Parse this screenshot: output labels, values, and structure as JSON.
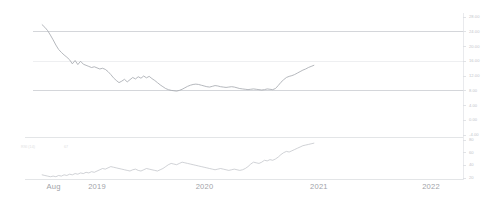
{
  "chart_data": {
    "type": "line",
    "title": "",
    "subtitle": "",
    "xlabel": "",
    "ylabel": "",
    "grid": true,
    "legend_position": "none",
    "panels": [
      {
        "name": "price-panel",
        "ylim": [
          -4,
          28
        ],
        "ytick_labels": [
          "28.00",
          "24.00",
          "20.00",
          "16.00",
          "12.00",
          "8.00",
          "4.00",
          "0.00",
          "-4.00"
        ],
        "ytick_values": [
          28,
          24,
          20,
          16,
          12,
          8,
          4,
          0,
          -4
        ],
        "gridline_values": [
          24,
          16,
          8
        ],
        "series": [
          {
            "name": "price",
            "color": "#a8abb1",
            "x": [
              0.0,
              0.6,
              1.2,
              1.8,
              2.4,
              3.0,
              3.6,
              4.2,
              4.8,
              5.4,
              6.0,
              6.6,
              7.2,
              7.8,
              8.4,
              9.0,
              9.6,
              10.2,
              10.8,
              11.4,
              12.0,
              12.6,
              13.2,
              13.8,
              14.4,
              15.0,
              15.6,
              16.2,
              16.8,
              17.4,
              18.0,
              18.6,
              19.2,
              19.8,
              20.4,
              21.0,
              21.6,
              22.2,
              22.8,
              23.4,
              24.0,
              24.6,
              25.2,
              25.8,
              26.4,
              27.0,
              27.6,
              28.2,
              28.8,
              29.4,
              30.0,
              30.6,
              31.2,
              31.8,
              32.4,
              33.0,
              33.6,
              34.2,
              34.8,
              35.4,
              36.0,
              36.6,
              37.2,
              37.8,
              38.4,
              39.0,
              39.6,
              40.2,
              40.8,
              41.4,
              42.0,
              42.6,
              43.2,
              43.8,
              44.4,
              45.0,
              45.6,
              46.2,
              46.8,
              47.4,
              48.0,
              48.6,
              49.2,
              49.8,
              50.4,
              51.0,
              51.6,
              52.2,
              52.8,
              53.4,
              54.0,
              54.6,
              55.2,
              55.8,
              56.4,
              57.0,
              57.6,
              58.2,
              58.8,
              59.4
            ],
            "y": [
              25.9,
              25.2,
              24.3,
              23.1,
              21.8,
              20.4,
              19.2,
              18.4,
              17.7,
              17.1,
              16.4,
              15.3,
              16.2,
              15.1,
              16.0,
              15.2,
              14.9,
              14.6,
              14.3,
              14.5,
              14.2,
              13.9,
              14.1,
              13.8,
              13.2,
              12.4,
              11.5,
              10.8,
              10.2,
              10.6,
              11.1,
              10.4,
              11.0,
              11.6,
              11.2,
              11.8,
              11.4,
              12.0,
              11.5,
              11.9,
              11.3,
              10.8,
              10.2,
              9.6,
              9.1,
              8.6,
              8.3,
              8.1,
              8.0,
              7.9,
              8.1,
              8.4,
              8.8,
              9.2,
              9.5,
              9.7,
              9.8,
              9.7,
              9.5,
              9.3,
              9.1,
              9.0,
              9.2,
              9.4,
              9.3,
              9.1,
              9.0,
              8.9,
              9.0,
              9.1,
              9.0,
              8.8,
              8.6,
              8.5,
              8.4,
              8.3,
              8.4,
              8.5,
              8.4,
              8.3,
              8.2,
              8.3,
              8.5,
              8.4,
              8.3,
              8.6,
              9.4,
              10.3,
              11.0,
              11.6,
              11.9,
              12.1,
              12.4,
              12.8,
              13.2,
              13.6,
              13.9,
              14.3,
              14.6,
              14.9
            ]
          }
        ]
      },
      {
        "name": "indicator-panel",
        "ylim": [
          20,
          80
        ],
        "ytick_labels": [
          "80",
          "60",
          "40",
          "20"
        ],
        "ytick_values": [
          80,
          60,
          40,
          20
        ],
        "gridline_values": [],
        "indicator_name": "RSI (14)",
        "indicator_value": "67",
        "series": [
          {
            "name": "rsi",
            "color": "#bcbfc4",
            "x": [
              0.0,
              0.6,
              1.2,
              1.8,
              2.4,
              3.0,
              3.6,
              4.2,
              4.8,
              5.4,
              6.0,
              6.6,
              7.2,
              7.8,
              8.4,
              9.0,
              9.6,
              10.2,
              10.8,
              11.4,
              12.0,
              12.6,
              13.2,
              13.8,
              14.4,
              15.0,
              15.6,
              16.2,
              16.8,
              17.4,
              18.0,
              18.6,
              19.2,
              19.8,
              20.4,
              21.0,
              21.6,
              22.2,
              22.8,
              23.4,
              24.0,
              24.6,
              25.2,
              25.8,
              26.4,
              27.0,
              27.6,
              28.2,
              28.8,
              29.4,
              30.0,
              30.6,
              31.2,
              31.8,
              32.4,
              33.0,
              33.6,
              34.2,
              34.8,
              35.4,
              36.0,
              36.6,
              37.2,
              37.8,
              38.4,
              39.0,
              39.6,
              40.2,
              40.8,
              41.4,
              42.0,
              42.6,
              43.2,
              43.8,
              44.4,
              45.0,
              45.6,
              46.2,
              46.8,
              47.4,
              48.0,
              48.6,
              49.2,
              49.8,
              50.4,
              51.0,
              51.6,
              52.2,
              52.8,
              53.4,
              54.0,
              54.6,
              55.2,
              55.8,
              56.4,
              57.0,
              57.6,
              58.2,
              58.8,
              59.4
            ],
            "y": [
              25,
              24,
              23,
              22,
              23,
              22,
              24,
              23,
              25,
              24,
              26,
              25,
              27,
              26,
              28,
              27,
              29,
              28,
              30,
              29,
              31,
              33,
              35,
              34,
              36,
              38,
              37,
              36,
              35,
              34,
              33,
              32,
              31,
              33,
              34,
              32,
              31,
              33,
              35,
              34,
              33,
              32,
              31,
              33,
              35,
              38,
              41,
              43,
              42,
              41,
              43,
              45,
              44,
              43,
              42,
              41,
              40,
              39,
              38,
              37,
              36,
              35,
              34,
              33,
              34,
              35,
              34,
              33,
              32,
              33,
              34,
              33,
              32,
              33,
              35,
              38,
              42,
              45,
              44,
              43,
              45,
              48,
              47,
              49,
              48,
              50,
              53,
              57,
              60,
              62,
              61,
              63,
              65,
              67,
              69,
              71,
              72,
              73,
              74,
              75
            ]
          }
        ]
      }
    ],
    "xtick_labels": [
      "Aug",
      "2019",
      "2020",
      "2021",
      "2022"
    ],
    "xtick_positions": [
      2.5,
      12.0,
      35.5,
      60.5,
      85.0
    ],
    "xlim": [
      -2,
      92
    ]
  }
}
